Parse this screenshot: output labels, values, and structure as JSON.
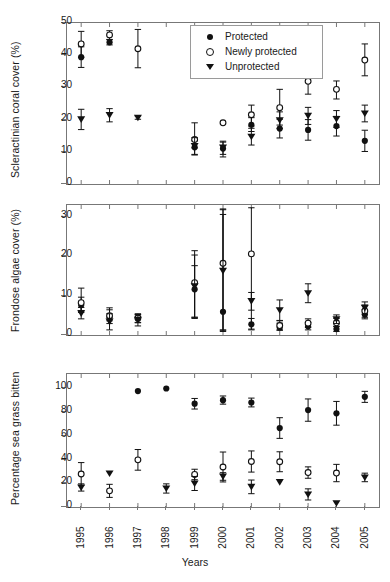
{
  "chart_data": {
    "type": "scatter",
    "title": "",
    "xlabel": "Years",
    "grid": false,
    "legend_position": "top-right-panel-1",
    "x": [
      1995,
      1996,
      1997,
      1998,
      1999,
      2000,
      2001,
      2002,
      2003,
      2004,
      2005
    ],
    "xtick_labels": [
      "1995",
      "1996",
      "1997",
      "1998",
      "1999",
      "2000",
      "2001",
      "2002",
      "2003",
      "2004",
      "2005"
    ],
    "xlim": [
      1994.5,
      2005.5
    ],
    "series_names": [
      "Protected",
      "Newly protected",
      "Unprotected"
    ],
    "series_markers": [
      "filled-circle",
      "open-circle",
      "filled-triangle-down"
    ],
    "panels": [
      {
        "id": "coral",
        "ylabel": "Scleractinian coral cover (%)",
        "ylim": [
          0,
          50
        ],
        "yticks": [
          0,
          10,
          20,
          30,
          40,
          50
        ],
        "ytick_labels": [
          "0",
          "10",
          "20",
          "30",
          "40",
          "50"
        ],
        "series": [
          {
            "name": "Protected",
            "marker": "filled-circle",
            "points": [
              {
                "x": 1995,
                "y": 39.4,
                "lo": 36.2,
                "hi": 42.6
              },
              {
                "x": 1996,
                "y": 44.0,
                "lo": 43.2,
                "hi": 44.8
              },
              {
                "x": 1999,
                "y": 11.4,
                "lo": 9.0,
                "hi": 13.4
              },
              {
                "x": 2000,
                "y": 11.0,
                "lo": 8.4,
                "hi": 13.3
              },
              {
                "x": 2001,
                "y": 18.4,
                "lo": 16.3,
                "hi": 20.6
              },
              {
                "x": 2002,
                "y": 17.2,
                "lo": 14.3,
                "hi": 20.1
              },
              {
                "x": 2003,
                "y": 16.8,
                "lo": 13.6,
                "hi": 20.0
              },
              {
                "x": 2004,
                "y": 18.0,
                "lo": 14.9,
                "hi": 21.0
              },
              {
                "x": 2005,
                "y": 13.4,
                "lo": 10.1,
                "hi": 16.7
              }
            ]
          },
          {
            "name": "Newly protected",
            "marker": "open-circle",
            "points": [
              {
                "x": 1995,
                "y": 43.5,
                "lo": 39.4,
                "hi": 47.4
              },
              {
                "x": 1996,
                "y": 46.3,
                "lo": 44.9,
                "hi": 47.6
              },
              {
                "x": 1997,
                "y": 42.0,
                "lo": 36.1,
                "hi": 48.0
              },
              {
                "x": 1999,
                "y": 13.8,
                "lo": 11.2,
                "hi": 19.0
              },
              {
                "x": 2000,
                "y": 19.0,
                "lo": 19.0,
                "hi": 19.0
              },
              {
                "x": 2001,
                "y": 21.5,
                "lo": 18.0,
                "hi": 24.5
              },
              {
                "x": 2002,
                "y": 23.7,
                "lo": 18.3,
                "hi": 29.4
              },
              {
                "x": 2003,
                "y": 31.9,
                "lo": 27.9,
                "hi": 35.8
              },
              {
                "x": 2004,
                "y": 29.4,
                "lo": 26.4,
                "hi": 32.0
              },
              {
                "x": 2005,
                "y": 38.5,
                "lo": 33.6,
                "hi": 43.5
              }
            ]
          },
          {
            "name": "Unprotected",
            "marker": "filled-triangle-down",
            "points": [
              {
                "x": 1995,
                "y": 20.1,
                "lo": 16.9,
                "hi": 23.2
              },
              {
                "x": 1996,
                "y": 21.4,
                "lo": 19.3,
                "hi": 23.4
              },
              {
                "x": 1997,
                "y": 20.6,
                "lo": 20.1,
                "hi": 21.1
              },
              {
                "x": 1999,
                "y": 11.8,
                "lo": 9.2,
                "hi": 14.4
              },
              {
                "x": 2000,
                "y": 11.3,
                "lo": 9.2,
                "hi": 13.0
              },
              {
                "x": 2001,
                "y": 14.7,
                "lo": 12.1,
                "hi": 17.3
              },
              {
                "x": 2002,
                "y": 19.8,
                "lo": 17.2,
                "hi": 22.4
              },
              {
                "x": 2003,
                "y": 21.2,
                "lo": 18.5,
                "hi": 23.8
              },
              {
                "x": 2004,
                "y": 20.2,
                "lo": 17.6,
                "hi": 22.8
              },
              {
                "x": 2005,
                "y": 21.9,
                "lo": 19.3,
                "hi": 24.5
              }
            ]
          }
        ]
      },
      {
        "id": "algae",
        "ylabel": "Frondose algae cover (%)",
        "ylim": [
          0,
          33
        ],
        "yticks": [
          0,
          10,
          20,
          30
        ],
        "ytick_labels": [
          "0",
          "10",
          "20",
          "30"
        ],
        "series": [
          {
            "name": "Protected",
            "marker": "filled-circle",
            "points": [
              {
                "x": 1995,
                "y": 7.6,
                "lo": 5.7,
                "hi": 9.6
              },
              {
                "x": 1996,
                "y": 4.4,
                "lo": 2.9,
                "hi": 6.4
              },
              {
                "x": 1997,
                "y": 4.1,
                "lo": 3.1,
                "hi": 5.1
              },
              {
                "x": 1999,
                "y": 11.6,
                "lo": 4.5,
                "hi": 17.6
              },
              {
                "x": 2000,
                "y": 5.9,
                "lo": 0.9,
                "hi": 30.6
              },
              {
                "x": 2001,
                "y": 2.7,
                "lo": 1.3,
                "hi": 4.2
              },
              {
                "x": 2002,
                "y": 1.9,
                "lo": 1.2,
                "hi": 3.0
              },
              {
                "x": 2003,
                "y": 2.2,
                "lo": 1.3,
                "hi": 3.2
              },
              {
                "x": 2004,
                "y": 1.5,
                "lo": 0.9,
                "hi": 2.2
              },
              {
                "x": 2005,
                "y": 5.2,
                "lo": 4.1,
                "hi": 6.4
              }
            ]
          },
          {
            "name": "Newly protected",
            "marker": "open-circle",
            "points": [
              {
                "x": 1995,
                "y": 8.2,
                "lo": 6.2,
                "hi": 11.9
              },
              {
                "x": 1996,
                "y": 4.9,
                "lo": 3.6,
                "hi": 6.9
              },
              {
                "x": 1997,
                "y": 4.3,
                "lo": 3.2,
                "hi": 5.4
              },
              {
                "x": 1999,
                "y": 13.3,
                "lo": 4.2,
                "hi": 21.4
              },
              {
                "x": 2000,
                "y": 18.2,
                "lo": 1.2,
                "hi": 31.8
              },
              {
                "x": 2001,
                "y": 20.6,
                "lo": 1.5,
                "hi": 32.3
              },
              {
                "x": 2002,
                "y": 2.4,
                "lo": 1.3,
                "hi": 3.6
              },
              {
                "x": 2003,
                "y": 3.0,
                "lo": 1.9,
                "hi": 4.1
              },
              {
                "x": 2004,
                "y": 3.1,
                "lo": 2.2,
                "hi": 4.2
              },
              {
                "x": 2005,
                "y": 6.1,
                "lo": 4.5,
                "hi": 7.6
              }
            ]
          },
          {
            "name": "Unprotected",
            "marker": "filled-triangle-down",
            "points": [
              {
                "x": 1995,
                "y": 5.5,
                "lo": 4.1,
                "hi": 7.0
              },
              {
                "x": 1996,
                "y": 3.4,
                "lo": 1.3,
                "hi": 5.4
              },
              {
                "x": 1997,
                "y": 3.9,
                "lo": 2.3,
                "hi": 5.2
              },
              {
                "x": 1999,
                "y": 12.4,
                "lo": 4.5,
                "hi": 20.3
              },
              {
                "x": 2000,
                "y": 16.3,
                "lo": 1.3,
                "hi": 32.0
              },
              {
                "x": 2001,
                "y": 8.6,
                "lo": 6.3,
                "hi": 10.8
              },
              {
                "x": 2002,
                "y": 6.3,
                "lo": 3.7,
                "hi": 8.9
              },
              {
                "x": 2003,
                "y": 10.6,
                "lo": 8.2,
                "hi": 13.0
              },
              {
                "x": 2004,
                "y": 4.0,
                "lo": 2.9,
                "hi": 5.1
              },
              {
                "x": 2005,
                "y": 6.9,
                "lo": 5.3,
                "hi": 8.4
              }
            ]
          }
        ]
      },
      {
        "id": "grass",
        "ylabel": "Percentage sea grass bitten",
        "ylim": [
          0,
          112
        ],
        "yticks": [
          0,
          20,
          40,
          60,
          80,
          100
        ],
        "ytick_labels": [
          "0",
          "20",
          "40",
          "60",
          "80",
          "100"
        ],
        "series": [
          {
            "name": "Protected",
            "marker": "filled-circle",
            "points": [
              {
                "x": 1997,
                "y": 97.6,
                "lo": 97.6,
                "hi": 97.6
              },
              {
                "x": 1998,
                "y": 99.8,
                "lo": 99.8,
                "hi": 99.8
              },
              {
                "x": 1999,
                "y": 87.0,
                "lo": 82.5,
                "hi": 91.4
              },
              {
                "x": 2000,
                "y": 90.0,
                "lo": 86.6,
                "hi": 93.5
              },
              {
                "x": 2001,
                "y": 88.0,
                "lo": 84.3,
                "hi": 91.7
              },
              {
                "x": 2002,
                "y": 66.5,
                "lo": 57.8,
                "hi": 75.2
              },
              {
                "x": 2003,
                "y": 81.6,
                "lo": 72.2,
                "hi": 91.0
              },
              {
                "x": 2004,
                "y": 78.9,
                "lo": 68.9,
                "hi": 88.9
              },
              {
                "x": 2005,
                "y": 92.8,
                "lo": 88.1,
                "hi": 97.4
              }
            ]
          },
          {
            "name": "Newly protected",
            "marker": "open-circle",
            "points": [
              {
                "x": 1995,
                "y": 27.8,
                "lo": 18.2,
                "hi": 37.4
              },
              {
                "x": 1996,
                "y": 13.6,
                "lo": 8.1,
                "hi": 19.1
              },
              {
                "x": 1997,
                "y": 39.7,
                "lo": 31.0,
                "hi": 48.4
              },
              {
                "x": 1999,
                "y": 27.4,
                "lo": 23.0,
                "hi": 31.8
              },
              {
                "x": 2000,
                "y": 33.7,
                "lo": 21.1,
                "hi": 46.3
              },
              {
                "x": 2001,
                "y": 38.3,
                "lo": 29.4,
                "hi": 47.2
              },
              {
                "x": 2002,
                "y": 38.1,
                "lo": 29.7,
                "hi": 46.5
              },
              {
                "x": 2003,
                "y": 29.0,
                "lo": 24.2,
                "hi": 33.8
              },
              {
                "x": 2004,
                "y": 28.6,
                "lo": 21.3,
                "hi": 35.9
              }
            ]
          },
          {
            "name": "Unprotected",
            "marker": "filled-triangle-down",
            "points": [
              {
                "x": 1995,
                "y": 16.5,
                "lo": 13.4,
                "hi": 19.5
              },
              {
                "x": 1996,
                "y": 28.3,
                "lo": 28.3,
                "hi": 28.3
              },
              {
                "x": 1998,
                "y": 15.6,
                "lo": 11.7,
                "hi": 19.5
              },
              {
                "x": 1999,
                "y": 19.8,
                "lo": 13.9,
                "hi": 25.7
              },
              {
                "x": 2000,
                "y": 25.7,
                "lo": 22.5,
                "hi": 28.9
              },
              {
                "x": 2001,
                "y": 17.0,
                "lo": 11.2,
                "hi": 22.7
              },
              {
                "x": 2002,
                "y": 21.0,
                "lo": 21.0,
                "hi": 21.0
              },
              {
                "x": 2003,
                "y": 10.6,
                "lo": 5.9,
                "hi": 15.3
              },
              {
                "x": 2004,
                "y": 3.2,
                "lo": 3.2,
                "hi": 3.2
              },
              {
                "x": 2005,
                "y": 24.9,
                "lo": 21.3,
                "hi": 28.5
              }
            ]
          }
        ]
      }
    ]
  },
  "legend": {
    "items": [
      {
        "label": "Protected",
        "marker": "filled-circle"
      },
      {
        "label": "Newly protected",
        "marker": "open-circle"
      },
      {
        "label": "Unprotected",
        "marker": "filled-triangle-down"
      }
    ]
  },
  "axis": {
    "xlabel": "Years"
  },
  "colors": {
    "marker": "#111111",
    "axis": "#777777",
    "background": "#ffffff"
  }
}
